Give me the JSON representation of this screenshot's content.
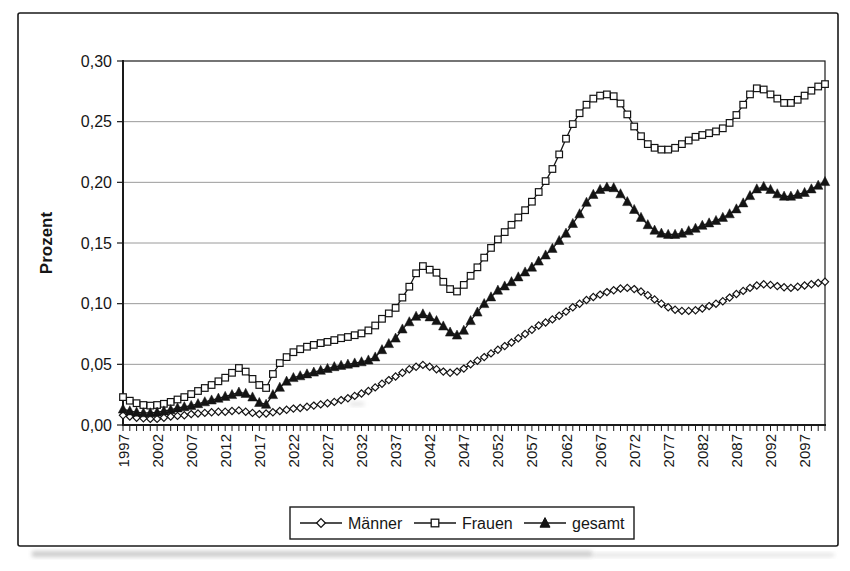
{
  "figure": {
    "background": "#ffffff",
    "border_color": "#1a1a1a",
    "line_color": "#141414",
    "grid_color": "#9a9a9a"
  },
  "chart_data": {
    "type": "line",
    "title": "",
    "xlabel": "",
    "ylabel": "Prozent",
    "ylim": [
      0,
      0.3
    ],
    "grid": "horizontal",
    "legend_position": "bottom",
    "decimal_style": "comma",
    "y_ticks": [
      {
        "v": 0.0,
        "label": "0,00"
      },
      {
        "v": 0.05,
        "label": "0,05"
      },
      {
        "v": 0.1,
        "label": "0,10"
      },
      {
        "v": 0.15,
        "label": "0,15"
      },
      {
        "v": 0.2,
        "label": "0,20"
      },
      {
        "v": 0.25,
        "label": "0,25"
      },
      {
        "v": 0.3,
        "label": "0,30"
      }
    ],
    "x_tick_years": [
      1997,
      2002,
      2007,
      2012,
      2017,
      2022,
      2027,
      2032,
      2037,
      2042,
      2047,
      2052,
      2057,
      2062,
      2067,
      2072,
      2077,
      2082,
      2087,
      2092,
      2097
    ],
    "x_start": 1997,
    "x_end": 2100,
    "series": [
      {
        "name": "Männer",
        "marker": "diamond-open",
        "color": "#141414",
        "values": [
          0.008,
          0.007,
          0.006,
          0.0055,
          0.005,
          0.005,
          0.006,
          0.007,
          0.0075,
          0.008,
          0.009,
          0.0095,
          0.01,
          0.0105,
          0.011,
          0.011,
          0.0115,
          0.012,
          0.011,
          0.01,
          0.009,
          0.0095,
          0.0105,
          0.0115,
          0.0125,
          0.0135,
          0.014,
          0.015,
          0.016,
          0.017,
          0.018,
          0.019,
          0.0205,
          0.022,
          0.024,
          0.026,
          0.028,
          0.031,
          0.034,
          0.037,
          0.04,
          0.043,
          0.046,
          0.048,
          0.0495,
          0.048,
          0.046,
          0.044,
          0.043,
          0.044,
          0.0465,
          0.05,
          0.053,
          0.056,
          0.059,
          0.062,
          0.065,
          0.068,
          0.0715,
          0.075,
          0.0785,
          0.082,
          0.0845,
          0.087,
          0.09,
          0.0935,
          0.097,
          0.1,
          0.103,
          0.1055,
          0.1075,
          0.1095,
          0.111,
          0.1125,
          0.113,
          0.112,
          0.11,
          0.107,
          0.1035,
          0.1,
          0.097,
          0.095,
          0.094,
          0.094,
          0.0945,
          0.096,
          0.098,
          0.1,
          0.102,
          0.105,
          0.108,
          0.1105,
          0.113,
          0.115,
          0.116,
          0.1155,
          0.1145,
          0.1135,
          0.113,
          0.114,
          0.115,
          0.116,
          0.117,
          0.118
        ]
      },
      {
        "name": "Frauen",
        "marker": "square-open",
        "color": "#141414",
        "values": [
          0.023,
          0.02,
          0.018,
          0.0165,
          0.016,
          0.0165,
          0.0175,
          0.019,
          0.021,
          0.023,
          0.0255,
          0.028,
          0.0305,
          0.033,
          0.036,
          0.039,
          0.043,
          0.047,
          0.044,
          0.038,
          0.033,
          0.0305,
          0.042,
          0.051,
          0.056,
          0.06,
          0.0625,
          0.0645,
          0.066,
          0.0675,
          0.0685,
          0.07,
          0.0715,
          0.0725,
          0.074,
          0.0755,
          0.078,
          0.082,
          0.0875,
          0.092,
          0.0965,
          0.105,
          0.114,
          0.125,
          0.131,
          0.128,
          0.1255,
          0.118,
          0.112,
          0.11,
          0.1155,
          0.123,
          0.13,
          0.138,
          0.146,
          0.153,
          0.159,
          0.165,
          0.171,
          0.177,
          0.184,
          0.192,
          0.201,
          0.211,
          0.223,
          0.236,
          0.248,
          0.257,
          0.264,
          0.269,
          0.2715,
          0.2725,
          0.271,
          0.265,
          0.256,
          0.246,
          0.238,
          0.2315,
          0.2285,
          0.227,
          0.227,
          0.2285,
          0.2315,
          0.2345,
          0.2375,
          0.239,
          0.2405,
          0.242,
          0.2445,
          0.249,
          0.2555,
          0.264,
          0.2725,
          0.2775,
          0.2765,
          0.2725,
          0.269,
          0.2655,
          0.2655,
          0.268,
          0.2715,
          0.2755,
          0.279,
          0.281
        ]
      },
      {
        "name": "gesamt",
        "marker": "triangle-filled",
        "color": "#141414",
        "values": [
          0.013,
          0.0115,
          0.0105,
          0.01,
          0.01,
          0.0105,
          0.0115,
          0.0125,
          0.014,
          0.015,
          0.016,
          0.0175,
          0.019,
          0.0205,
          0.022,
          0.0235,
          0.025,
          0.027,
          0.026,
          0.023,
          0.0185,
          0.017,
          0.025,
          0.031,
          0.036,
          0.039,
          0.0405,
          0.042,
          0.0435,
          0.045,
          0.0465,
          0.048,
          0.049,
          0.05,
          0.051,
          0.052,
          0.0535,
          0.056,
          0.062,
          0.067,
          0.0715,
          0.079,
          0.085,
          0.0895,
          0.0915,
          0.089,
          0.086,
          0.0815,
          0.0765,
          0.074,
          0.078,
          0.086,
          0.093,
          0.1,
          0.1055,
          0.111,
          0.1145,
          0.118,
          0.122,
          0.126,
          0.13,
          0.135,
          0.14,
          0.1455,
          0.152,
          0.158,
          0.166,
          0.174,
          0.1835,
          0.19,
          0.194,
          0.196,
          0.1955,
          0.1905,
          0.184,
          0.1775,
          0.171,
          0.165,
          0.1605,
          0.158,
          0.157,
          0.157,
          0.158,
          0.16,
          0.162,
          0.1645,
          0.1665,
          0.1685,
          0.171,
          0.174,
          0.178,
          0.183,
          0.189,
          0.1945,
          0.1965,
          0.194,
          0.1905,
          0.1885,
          0.1885,
          0.19,
          0.1915,
          0.1945,
          0.1975,
          0.2005
        ]
      }
    ]
  }
}
